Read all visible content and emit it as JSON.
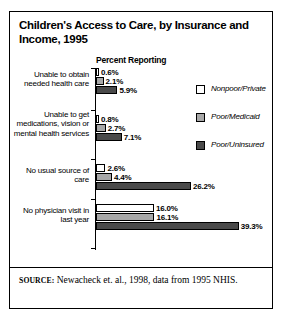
{
  "figure": {
    "title": "Children's Access to Care, by Insurance and Income, 1995",
    "axis_title": "Percent Reporting",
    "source_tag": "SOURCE:",
    "source_text": " Newacheck et. al., 1998, data from 1995 NHIS."
  },
  "legend": {
    "items": [
      {
        "label": "Nonpoor/Private",
        "color": "#ffffff"
      },
      {
        "label": "Poor/Medicaid",
        "color": "#a8a8a8"
      },
      {
        "label": "Poor/Uninsured",
        "color": "#4a4a4a"
      }
    ]
  },
  "chart_data": {
    "type": "bar",
    "orientation": "horizontal",
    "title": "Children's Access to Care, by Insurance and Income, 1995",
    "xlabel": "Percent Reporting",
    "ylabel": "",
    "xlim": [
      0,
      39.3
    ],
    "grid": false,
    "legend_position": "right",
    "categories": [
      "Unable to obtain needed health care",
      "Unable to get medications, vision or mental health services",
      "No usual source of care",
      "No physician visit in last year"
    ],
    "series": [
      {
        "name": "Nonpoor/Private",
        "color": "#ffffff",
        "values": [
          0.6,
          0.8,
          2.6,
          16.0
        ]
      },
      {
        "name": "Poor/Medicaid",
        "color": "#a8a8a8",
        "values": [
          2.1,
          2.7,
          4.4,
          16.1
        ]
      },
      {
        "name": "Poor/Uninsured",
        "color": "#4a4a4a",
        "values": [
          5.9,
          7.1,
          26.2,
          39.3
        ]
      }
    ],
    "value_labels": [
      [
        "0.6%",
        "2.1%",
        "5.9%"
      ],
      [
        "0.8%",
        "2.7%",
        "7.1%"
      ],
      [
        "2.6%",
        "4.4%",
        "26.2%"
      ],
      [
        "16.0%",
        "16.1%",
        "39.3%"
      ]
    ]
  }
}
